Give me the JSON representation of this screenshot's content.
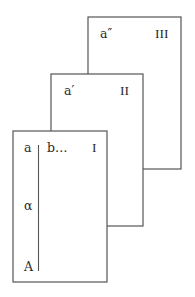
{
  "diagram": {
    "panels": [
      {
        "id": "III",
        "numeral": "III",
        "corner_label": "a″"
      },
      {
        "id": "II",
        "numeral": "II",
        "corner_label": "a′"
      },
      {
        "id": "I",
        "numeral": "I",
        "corner_label": "a",
        "header_continuation": "b…",
        "margin_labels": [
          "α",
          "A"
        ]
      }
    ]
  }
}
